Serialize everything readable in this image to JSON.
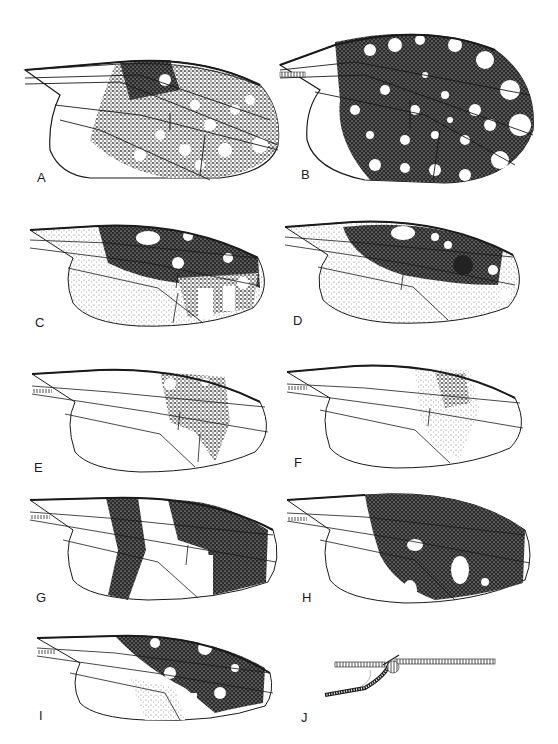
{
  "figure": {
    "type": "plate of insect wing illustrations",
    "panels": [
      {
        "id": "A",
        "label": "A",
        "pattern": "dark disc with many round hyaline spots, fringed margin"
      },
      {
        "id": "B",
        "label": "B",
        "pattern": "broad wing densely dark with many round hyaline spots"
      },
      {
        "id": "C",
        "label": "C",
        "pattern": "dark band along costa with few spots, pale stippled rear"
      },
      {
        "id": "D",
        "label": "D",
        "pattern": "dark costal area with dark subapical spot, light streaks"
      },
      {
        "id": "E",
        "label": "E",
        "pattern": "small stippled patch near apex"
      },
      {
        "id": "F",
        "label": "F",
        "pattern": "light stippled patch at mid-distal wing"
      },
      {
        "id": "G",
        "label": "G",
        "pattern": "two dark crossbands separated by hyaline band"
      },
      {
        "id": "H",
        "label": "H",
        "pattern": "nearly whole distal wing dark with few hyaline spots"
      },
      {
        "id": "I",
        "label": "I",
        "pattern": "dark reticulate pattern with hyaline spots and streaks"
      },
      {
        "id": "J",
        "label": "J",
        "pattern": "detail of wing base veins"
      }
    ]
  },
  "colors": {
    "ink": "#1a1a1a",
    "background": "#ffffff"
  }
}
